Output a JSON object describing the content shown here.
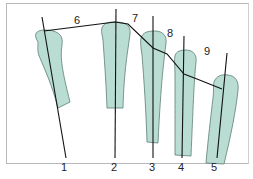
{
  "diagram": {
    "type": "metacarpal-head-alignment",
    "colors": {
      "bone_fill": "#b9ddd3",
      "bone_stroke": "#4a6b63",
      "line": "#111111",
      "frame": "#b8b8b8"
    },
    "axis_labels": [
      "1",
      "2",
      "3",
      "4",
      "5"
    ],
    "segment_labels": [
      "6",
      "7",
      "8",
      "9"
    ]
  }
}
